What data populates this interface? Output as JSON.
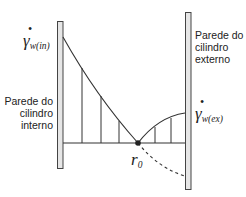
{
  "diagram": {
    "title": "",
    "colors": {
      "stroke": "#333333",
      "wall_fill": "#e6e6e6",
      "wall_stroke": "#444444"
    },
    "walls": {
      "inner": {
        "label_lines": [
          "Parede do",
          "cilindro",
          "interno"
        ],
        "rect": {
          "x": 57,
          "y": 21,
          "w": 6,
          "h": 148
        }
      },
      "outer": {
        "label_lines": [
          "Parede do",
          "cilindro",
          "externo"
        ],
        "rect": {
          "x": 185,
          "y": 12,
          "w": 6,
          "h": 178
        }
      }
    },
    "symbols": {
      "gamma_in": {
        "main": "γ",
        "dot": "•",
        "sub": "w(in)"
      },
      "gamma_ex": {
        "main": "γ",
        "dot": "•",
        "sub": "w(ex)"
      },
      "r0": {
        "main": "r",
        "sub": "0"
      }
    },
    "baseline_y": 143,
    "r0_point": {
      "x": 138,
      "y": 143
    },
    "left_profile": {
      "start": {
        "x": 63,
        "y": 37
      },
      "end": {
        "x": 138,
        "y": 143
      },
      "verticals_x": [
        82,
        101,
        119
      ]
    },
    "right_profile": {
      "start": {
        "x": 138,
        "y": 143
      },
      "end": {
        "x": 185,
        "y": 113
      },
      "verticals": [
        {
          "x": 155,
          "top": 128
        },
        {
          "x": 171,
          "top": 119
        }
      ]
    },
    "dashed_curve": {
      "start": {
        "x": 138,
        "y": 143
      },
      "end": {
        "x": 185,
        "y": 176
      }
    }
  }
}
